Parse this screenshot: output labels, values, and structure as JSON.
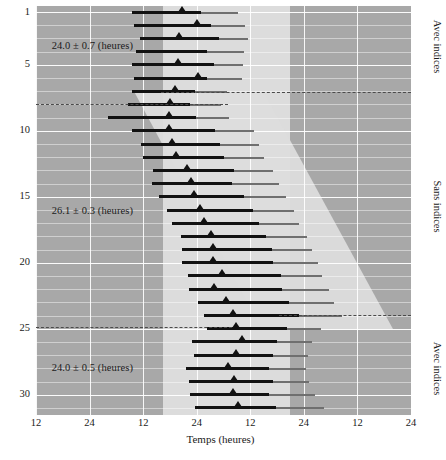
{
  "chart_data": {
    "type": "bar",
    "title": "",
    "xlabel": "Temps (heures)",
    "ylabel": "Temps (jours)",
    "xticklabels": [
      "12",
      "24",
      "12",
      "24",
      "12",
      "24",
      "12",
      "24"
    ],
    "xtick_hours": [
      12,
      24,
      36,
      48,
      60,
      72,
      84,
      96
    ],
    "xlim": [
      12,
      96
    ],
    "yticklabels": [
      "1",
      "5",
      "10",
      "15",
      "20",
      "25",
      "30"
    ],
    "ytick_days": [
      1,
      5,
      10,
      15,
      20,
      25,
      30
    ],
    "ylim": [
      0.5,
      31.5
    ],
    "grid": true,
    "legend_position": "none",
    "right_axis_labels": [
      "Avec indices",
      "Sans indices",
      "Avec indices"
    ],
    "annotations": [
      {
        "text": "24.0 ± 0.7 (heures)",
        "day": 3.6,
        "hour": 15.5
      },
      {
        "text": "26.1 ± 0.3 (heures)",
        "day": 16.1,
        "hour": 15.5
      },
      {
        "text": "24.0 ± 0.5 (heures)",
        "day": 28.0,
        "hour": 15.5
      }
    ],
    "regime_boundaries_day": [
      7.0,
      7.9,
      23.9,
      24.8
    ],
    "series": [
      {
        "name": "Periode de sommeil (noir)",
        "color": "#111111"
      },
      {
        "name": "Periode d'eveil prolonge (gris)",
        "color": "#6f6f6f"
      },
      {
        "name": "Minimum de temperature (triangle)",
        "color": "#111111"
      }
    ],
    "rows": [
      {
        "day": 1,
        "black_start": 33.4,
        "black_end": 49.0,
        "grey_end": 57.3,
        "marker": 44.6
      },
      {
        "day": 2,
        "black_start": 34.0,
        "black_end": 51.2,
        "grey_end": 58.8,
        "marker": 48.1
      },
      {
        "day": 3,
        "black_start": 35.4,
        "black_end": 53.0,
        "grey_end": 59.6,
        "marker": 44.0
      },
      {
        "day": 4,
        "black_start": 34.4,
        "black_end": 50.2,
        "grey_end": 58.6,
        "marker": null
      },
      {
        "day": 5,
        "black_start": 33.4,
        "black_end": 51.8,
        "grey_end": 58.4,
        "marker": 43.8
      },
      {
        "day": 6,
        "black_start": 34.0,
        "black_end": 50.3,
        "grey_end": 58.1,
        "marker": 48.3
      },
      {
        "day": 7,
        "black_start": 33.4,
        "black_end": 47.7,
        "grey_end": 54.8,
        "marker": 43.2
      },
      {
        "day": 8,
        "black_start": 32.5,
        "black_end": 46.5,
        "grey_end": 53.5,
        "marker": 42.1
      },
      {
        "day": 9,
        "black_start": 28.1,
        "black_end": 47.9,
        "grey_end": 55.2,
        "marker": 41.8
      },
      {
        "day": 10,
        "black_start": 33.5,
        "black_end": 52.2,
        "grey_end": 60.8,
        "marker": 41.7
      },
      {
        "day": 11,
        "black_start": 35.5,
        "black_end": 53.2,
        "grey_end": 62.0,
        "marker": 42.4
      },
      {
        "day": 12,
        "black_start": 36.0,
        "black_end": 54.2,
        "grey_end": 63.0,
        "marker": 43.3
      },
      {
        "day": 13,
        "black_start": 38.2,
        "black_end": 56.4,
        "grey_end": 65.2,
        "marker": 45.9
      },
      {
        "day": 14,
        "black_start": 38.0,
        "black_end": 56.0,
        "grey_end": 66.5,
        "marker": 46.7
      },
      {
        "day": 15,
        "black_start": 39.6,
        "black_end": 58.5,
        "grey_end": 68.0,
        "marker": 47.5
      },
      {
        "day": 16,
        "black_start": 41.3,
        "black_end": 60.5,
        "grey_end": 69.8,
        "marker": 48.8
      },
      {
        "day": 17,
        "black_start": 42.5,
        "black_end": 62.0,
        "grey_end": 71.0,
        "marker": 49.6
      },
      {
        "day": 18,
        "black_start": 44.5,
        "black_end": 63.6,
        "grey_end": 72.6,
        "marker": 51.3
      },
      {
        "day": 19,
        "black_start": 44.7,
        "black_end": 64.8,
        "grey_end": 73.8,
        "marker": 51.6
      },
      {
        "day": 20,
        "black_start": 44.8,
        "black_end": 65.2,
        "grey_end": 75.2,
        "marker": 51.7
      },
      {
        "day": 21,
        "black_start": 46.0,
        "black_end": 66.8,
        "grey_end": 76.0,
        "marker": 53.6
      },
      {
        "day": 22,
        "black_start": 46.2,
        "black_end": 67.0,
        "grey_end": 77.6,
        "marker": 51.9
      },
      {
        "day": 23,
        "black_start": 48.3,
        "black_end": 68.6,
        "grey_end": 78.8,
        "marker": 54.6
      },
      {
        "day": 24,
        "black_start": 49.6,
        "black_end": 71.0,
        "grey_end": 80.6,
        "marker": 56.2
      },
      {
        "day": 25,
        "black_start": 50.2,
        "black_end": 68.2,
        "grey_end": 75.8,
        "marker": 56.7
      },
      {
        "day": 26,
        "black_start": 47.0,
        "black_end": 66.0,
        "grey_end": 73.8,
        "marker": 58.2
      },
      {
        "day": 27,
        "black_start": 47.4,
        "black_end": 65.0,
        "grey_end": 73.0,
        "marker": 56.9
      },
      {
        "day": 28,
        "black_start": 45.6,
        "black_end": 64.2,
        "grey_end": 72.5,
        "marker": 55.0
      },
      {
        "day": 29,
        "black_start": 46.2,
        "black_end": 65.0,
        "grey_end": 73.2,
        "marker": 56.4
      },
      {
        "day": 30,
        "black_start": 46.4,
        "black_end": 64.2,
        "grey_end": 74.4,
        "marker": 56.2
      },
      {
        "day": 31,
        "black_start": 47.6,
        "black_end": 65.8,
        "grey_end": 76.6,
        "marker": 57.2
      }
    ]
  },
  "colors": {
    "ground_dark": "#a8a8a8",
    "band_light": "#dcdcdc",
    "bar_black": "#111111",
    "bar_grey": "#6f6f6f",
    "gridline": "#ffffff",
    "boundary_dash": "#4a4a4a",
    "text": "#1a1a1a"
  }
}
